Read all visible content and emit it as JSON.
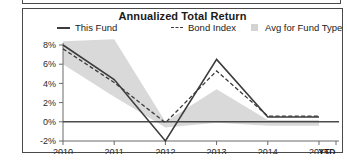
{
  "panel": {
    "title": "Annualized Total Return"
  },
  "legend": {
    "items": [
      {
        "label": "This Fund",
        "marker": "solid-line-swatch",
        "color": "#3c3c3c"
      },
      {
        "label": "Bond Index",
        "marker": "dashed-line-swatch",
        "color": "#3c3c3c"
      },
      {
        "label": "Avg for Fund Type",
        "marker": "filled-square-swatch",
        "color": "#d3d3d3"
      }
    ]
  },
  "axis": {
    "y_ticks": [
      "8%",
      "6%",
      "4%",
      "2%",
      "0%",
      "-2%"
    ],
    "x_ticks": [
      "2010",
      "2011",
      "2012",
      "2013",
      "2014",
      "2015"
    ],
    "x_end_label": "YTD"
  },
  "chart_data": {
    "type": "line",
    "title": "Annualized Total Return",
    "xlabel": "",
    "ylabel": "",
    "ylim": [
      -2,
      8
    ],
    "y_ticks": [
      8,
      6,
      4,
      2,
      0,
      -2
    ],
    "y_tick_labels": [
      "8%",
      "6%",
      "4%",
      "2%",
      "0%",
      "-2%"
    ],
    "x": [
      "2010",
      "2011",
      "2012",
      "2013",
      "2014",
      "2015"
    ],
    "x_tick_labels": [
      "2010",
      "2011",
      "2012",
      "2013",
      "2014",
      "2015"
    ],
    "x_end_label": "YTD",
    "grid": false,
    "legend_position": "top",
    "zero_line": 0,
    "series": [
      {
        "name": "This Fund",
        "style": "solid",
        "color": "#3c3c3c",
        "values": [
          8.0,
          4.4,
          -2.0,
          6.5,
          0.5,
          0.5
        ]
      },
      {
        "name": "Bond Index",
        "style": "dashed",
        "color": "#3c3c3c",
        "values": [
          7.6,
          4.1,
          -0.1,
          5.3,
          0.6,
          0.6
        ]
      },
      {
        "name": "Avg for Fund Type",
        "style": "band",
        "color": "#d9d9d9",
        "band_upper": [
          8.4,
          8.6,
          0.0,
          3.4,
          0.2,
          0.2
        ],
        "band_lower": [
          6.0,
          2.6,
          -0.6,
          -0.1,
          -0.4,
          -0.4
        ]
      }
    ]
  }
}
